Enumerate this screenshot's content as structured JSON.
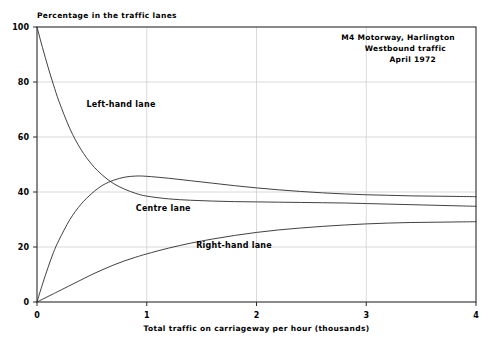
{
  "chart_data": {
    "type": "line",
    "title": "Percentage in the traffic lanes",
    "xlabel": "Total traffic on carriageway per hour (thousands)",
    "ylabel": "",
    "xlim": [
      0,
      4
    ],
    "ylim": [
      0,
      100
    ],
    "xticks": [
      "0",
      "1",
      "2",
      "3",
      "4"
    ],
    "xtick_values": [
      0,
      1,
      2,
      3,
      4
    ],
    "yticks": [
      "0",
      "20",
      "40",
      "60",
      "80",
      "100"
    ],
    "ytick_values": [
      0,
      20,
      40,
      60,
      80,
      100
    ],
    "grid": true,
    "grid_color": "#c9c9c9",
    "legend_position": "inline-labels",
    "line_color": "#2b2b2b",
    "annotation": {
      "lines": [
        "M4 Motorway, Harlington",
        "Westbound traffic",
        "April 1972"
      ],
      "position": "top-right"
    },
    "series": [
      {
        "name": "Left-hand lane",
        "label_x": 0.45,
        "label_y": 71,
        "x": [
          0,
          0.05,
          0.1,
          0.15,
          0.2,
          0.3,
          0.4,
          0.5,
          0.6,
          0.7,
          0.8,
          0.9,
          1.0,
          1.2,
          1.4,
          1.6,
          1.8,
          2.0,
          2.2,
          2.4,
          2.6,
          2.8,
          3.0,
          3.2,
          3.4,
          3.6,
          3.8,
          4.0
        ],
        "values": [
          100,
          92.5,
          85.5,
          79,
          73,
          63,
          55.5,
          50,
          46,
          43,
          41,
          39.5,
          38.5,
          37.5,
          37,
          36.7,
          36.5,
          36.4,
          36.3,
          36.2,
          36.1,
          36.0,
          35.8,
          35.6,
          35.4,
          35.2,
          35.0,
          34.8
        ]
      },
      {
        "name": "Centre lane",
        "label_x": 0.9,
        "label_y": 33,
        "x": [
          0,
          0.05,
          0.1,
          0.15,
          0.2,
          0.3,
          0.4,
          0.5,
          0.6,
          0.7,
          0.8,
          0.9,
          1.0,
          1.2,
          1.4,
          1.6,
          1.8,
          2.0,
          2.2,
          2.4,
          2.6,
          2.8,
          3.0,
          3.2,
          3.4,
          3.6,
          3.8,
          4.0
        ],
        "values": [
          0,
          6.5,
          12.5,
          18,
          22.5,
          30,
          35.5,
          39.5,
          42.5,
          44.3,
          45.4,
          45.8,
          45.7,
          45.0,
          44.1,
          43.2,
          42.3,
          41.5,
          40.8,
          40.2,
          39.7,
          39.3,
          39.0,
          38.8,
          38.6,
          38.5,
          38.4,
          38.3
        ]
      },
      {
        "name": "Right-hand lane",
        "label_x": 1.45,
        "label_y": 19.5,
        "x": [
          0,
          0.05,
          0.1,
          0.15,
          0.2,
          0.3,
          0.4,
          0.5,
          0.6,
          0.7,
          0.8,
          0.9,
          1.0,
          1.2,
          1.4,
          1.6,
          1.8,
          2.0,
          2.2,
          2.4,
          2.6,
          2.8,
          3.0,
          3.2,
          3.4,
          3.6,
          3.8,
          4.0
        ],
        "values": [
          0,
          1.0,
          2.0,
          3.0,
          4.0,
          6.0,
          8.0,
          10.0,
          11.8,
          13.5,
          15.0,
          16.3,
          17.5,
          19.6,
          21.4,
          22.9,
          24.2,
          25.3,
          26.2,
          26.9,
          27.5,
          28.0,
          28.4,
          28.7,
          28.9,
          29.0,
          29.1,
          29.2
        ]
      }
    ]
  }
}
